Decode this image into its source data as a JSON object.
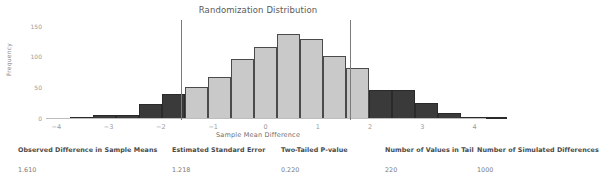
{
  "chart_data": {
    "type": "bar",
    "title": "Randomization Distribution",
    "xlabel": "Sample Mean Difference",
    "ylabel": "Frequency",
    "xlim": [
      -4.4,
      4.6
    ],
    "ylim": [
      0,
      160
    ],
    "xticks": [
      -4,
      -3,
      -2,
      -1,
      0,
      1,
      2,
      3,
      4
    ],
    "xtick_labels": [
      "−4",
      "−3",
      "−2",
      "−1",
      "0",
      "1",
      "2",
      "3",
      "4"
    ],
    "yticks": [
      0,
      50,
      100,
      150
    ],
    "ytick_labels": [
      "0",
      "50",
      "100",
      "150"
    ],
    "grid": false,
    "legend": null,
    "bin_width": 0.44,
    "colors": {
      "center_bar": "#c9c9c9",
      "tail_bar": "#3a3a3a",
      "bar_edge": "#4a4a4a",
      "reference_line": "#7b7b7b",
      "axis_text": "#9a9a9a"
    },
    "reference_lines": [
      -1.61,
      1.61
    ],
    "bins": [
      {
        "x": -3.52,
        "value": 2,
        "tail": true
      },
      {
        "x": -3.08,
        "value": 6,
        "tail": true
      },
      {
        "x": -2.64,
        "value": 7,
        "tail": true
      },
      {
        "x": -2.2,
        "value": 24,
        "tail": true
      },
      {
        "x": -1.76,
        "value": 41,
        "tail": true
      },
      {
        "x": -1.32,
        "value": 52,
        "tail": false
      },
      {
        "x": -0.88,
        "value": 68,
        "tail": false
      },
      {
        "x": -0.44,
        "value": 98,
        "tail": false
      },
      {
        "x": 0.0,
        "value": 118,
        "tail": false
      },
      {
        "x": 0.44,
        "value": 138,
        "tail": false
      },
      {
        "x": 0.88,
        "value": 131,
        "tail": false
      },
      {
        "x": 1.32,
        "value": 102,
        "tail": false
      },
      {
        "x": 1.76,
        "value": 84,
        "tail": false
      },
      {
        "x": 2.2,
        "value": 48,
        "tail": true
      },
      {
        "x": 2.64,
        "value": 48,
        "tail": true
      },
      {
        "x": 3.08,
        "value": 26,
        "tail": true
      },
      {
        "x": 3.52,
        "value": 10,
        "tail": true
      },
      {
        "x": 3.96,
        "value": 3,
        "tail": true
      },
      {
        "x": 4.4,
        "value": 2,
        "tail": true
      }
    ]
  },
  "summary": {
    "headers": [
      "Observed Difference in Sample Means",
      "Estimated Standard Error",
      "Two-Tailed P-value",
      "Number of Values in Tail",
      "Number of Simulated Differences"
    ],
    "values": [
      "1.610",
      "1.218",
      "0.220",
      "220",
      "1000"
    ]
  }
}
